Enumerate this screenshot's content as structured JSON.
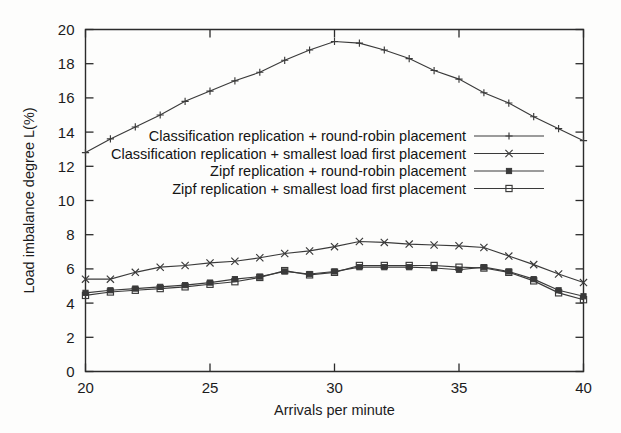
{
  "chart_data": {
    "type": "line",
    "title": "",
    "xlabel": "Arrivals per minute",
    "ylabel": "Load imbalance degree L(%)",
    "xlim": [
      20,
      40
    ],
    "ylim": [
      0,
      20
    ],
    "xticks": [
      20,
      25,
      30,
      35,
      40
    ],
    "yticks": [
      0,
      2,
      4,
      6,
      8,
      10,
      12,
      14,
      16,
      18,
      20
    ],
    "xtick_labels": [
      "20",
      "25",
      "30",
      "35",
      "40"
    ],
    "ytick_labels": [
      "0",
      "2",
      "4",
      "6",
      "8",
      "10",
      "12",
      "14",
      "16",
      "18",
      "20"
    ],
    "grid": false,
    "legend_position": "upper-center",
    "x": [
      20,
      21,
      22,
      23,
      24,
      25,
      26,
      27,
      28,
      29,
      30,
      31,
      32,
      33,
      34,
      35,
      36,
      37,
      38,
      39,
      40
    ],
    "series": [
      {
        "name": "Classification replication + round-robin placement",
        "marker": "plus",
        "values": [
          12.8,
          13.6,
          14.3,
          15.0,
          15.8,
          16.4,
          17.0,
          17.5,
          18.2,
          18.8,
          19.3,
          19.2,
          18.8,
          18.3,
          17.6,
          17.1,
          16.3,
          15.7,
          14.9,
          14.2,
          13.5
        ]
      },
      {
        "name": "Classification replication + smallest load first placement",
        "marker": "cross",
        "values": [
          5.4,
          5.4,
          5.8,
          6.1,
          6.2,
          6.35,
          6.45,
          6.65,
          6.9,
          7.05,
          7.3,
          7.6,
          7.55,
          7.45,
          7.4,
          7.35,
          7.25,
          6.75,
          6.25,
          5.7,
          5.2
        ]
      },
      {
        "name": "Zipf replication + round-robin placement",
        "marker": "filled-square",
        "values": [
          4.6,
          4.75,
          4.85,
          4.95,
          5.05,
          5.2,
          5.4,
          5.55,
          5.85,
          5.7,
          5.85,
          6.1,
          6.1,
          6.1,
          6.05,
          5.95,
          6.1,
          5.85,
          5.4,
          4.75,
          4.4
        ]
      },
      {
        "name": "Zipf replication + smallest load first placement",
        "marker": "open-square",
        "values": [
          4.45,
          4.65,
          4.75,
          4.85,
          4.95,
          5.1,
          5.25,
          5.5,
          5.9,
          5.65,
          5.8,
          6.2,
          6.2,
          6.2,
          6.2,
          6.1,
          6.05,
          5.8,
          5.3,
          4.6,
          4.2
        ]
      }
    ]
  }
}
